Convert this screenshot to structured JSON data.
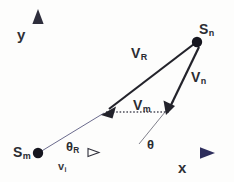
{
  "figure": {
    "type": "vector-diagram",
    "width": 234,
    "height": 182,
    "background_color": "#fdfdfc"
  },
  "axes": {
    "x_label": "x",
    "y_label": "y",
    "origin_label": "S",
    "x_axis_color": "#5a4f86",
    "y_axis_color": "#4a4a52",
    "arrow_color": "#3b3b63"
  },
  "points": [
    {
      "id": "sm",
      "base": "S",
      "sub": "m",
      "label": "Sm",
      "x": 38,
      "y": 153,
      "dot_color": "#1b1b26"
    },
    {
      "id": "sn",
      "base": "S",
      "sub": "n",
      "label": "Sn",
      "x": 196,
      "y": 42,
      "dot_color": "#1b1b26"
    }
  ],
  "vectors": [
    {
      "id": "vr",
      "base": "V",
      "sub": "R",
      "label": "VR",
      "from_x": 196,
      "from_y": 42,
      "to_x": 103,
      "to_y": 113,
      "color": "#232329",
      "style": "solid",
      "head": "arrow"
    },
    {
      "id": "vn",
      "base": "V",
      "sub": "n",
      "label": "Vn",
      "from_x": 200,
      "from_y": 46,
      "to_x": 167,
      "to_y": 113,
      "color": "#232329",
      "style": "solid",
      "head": "arrow"
    },
    {
      "id": "vm",
      "base": "V",
      "sub": "m",
      "label": "Vm",
      "from_x": 106,
      "from_y": 112,
      "to_x": 168,
      "to_y": 112,
      "color": "#4a4a55",
      "style": "dotted",
      "head": "none"
    },
    {
      "id": "vi",
      "base": "v",
      "sub": "i",
      "label": "vi",
      "from_x": 38,
      "from_y": 153,
      "to_x": 97,
      "to_y": 153,
      "color": "#5a4f86",
      "style": "solid",
      "head": "small-arrow"
    }
  ],
  "angles": [
    {
      "id": "theta-r",
      "base": "θ",
      "sub": "R",
      "label": "θR",
      "vertex_x": 38,
      "vertex_y": 153,
      "ray_to_x": 103,
      "ray_to_y": 113,
      "ray_color": "#55557a"
    },
    {
      "id": "theta",
      "base": "θ",
      "sub": "",
      "label": "θ",
      "vertex_x": 140,
      "vertex_y": 143,
      "ray_to_x": 172,
      "ray_to_y": 104,
      "ray_color": "#6a6a7c"
    }
  ],
  "labels": {
    "y": "y",
    "x": "x",
    "sm_base": "S",
    "sm_sub": "m",
    "sn_base": "S",
    "sn_sub": "n",
    "vr_base": "V",
    "vr_sub": "R",
    "vn_base": "V",
    "vn_sub": "n",
    "vm_base": "V",
    "vm_sub": "m",
    "vi_base": "v",
    "vi_sub": "i",
    "thetar_base": "θ",
    "thetar_sub": "R",
    "theta_base": "θ"
  }
}
